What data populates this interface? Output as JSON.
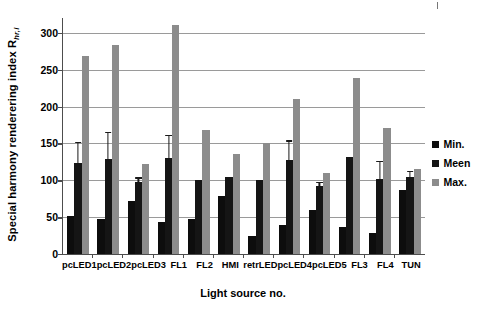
{
  "chart_data": {
    "type": "bar",
    "title": "",
    "xlabel": "Light source no.",
    "ylabel": "Special harmony renderering index R",
    "ylabel_sub": "hr,i",
    "ylim": [
      0,
      320
    ],
    "yticks": [
      0,
      50,
      100,
      150,
      200,
      250,
      300
    ],
    "grid": true,
    "legend_position": "right",
    "categories": [
      "pcLED1",
      "pcLED2",
      "pcLED3",
      "FL1",
      "FL2",
      "HMI",
      "retrLED",
      "pcLED4",
      "pcLED5",
      "FL3",
      "FL4",
      "TUN"
    ],
    "series": [
      {
        "name": "Min.",
        "color": "#0d0d0d",
        "values": [
          52,
          47,
          72,
          44,
          48,
          79,
          25,
          39,
          60,
          36,
          29,
          87
        ]
      },
      {
        "name": "Meen",
        "color": "#151515",
        "values": [
          123,
          129,
          97,
          130,
          100,
          104,
          100,
          127,
          92,
          131,
          102,
          104
        ],
        "errors": [
          29,
          37,
          7,
          32,
          0,
          0,
          0,
          27,
          6,
          0,
          24,
          9
        ]
      },
      {
        "name": "Max.",
        "color": "#8c8c8c",
        "values": [
          268,
          283,
          122,
          311,
          168,
          136,
          151,
          210,
          110,
          239,
          171,
          115
        ]
      }
    ]
  },
  "legend": {
    "items": [
      {
        "label": "Min.",
        "color": "#0d0d0d"
      },
      {
        "label": "Meen",
        "color": "#151515"
      },
      {
        "label": "Max.",
        "color": "#8c8c8c"
      }
    ]
  }
}
